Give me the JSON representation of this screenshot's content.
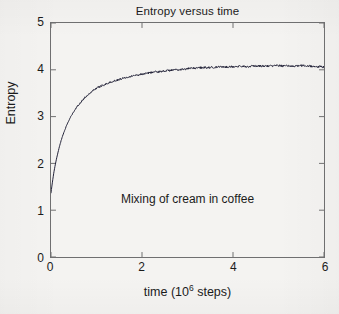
{
  "figure": {
    "background_color": "#f4f3f1",
    "frame_color": "#6f6f70",
    "text_color": "#1b1b1b"
  },
  "chart_data": {
    "type": "line",
    "title": "Entropy versus time",
    "xlabel_prefix": "time (10",
    "xlabel_exponent": "6",
    "xlabel_suffix": " steps)",
    "xlabel_full": "time (10^6 steps)",
    "ylabel": "Entropy",
    "annotation": "Mixing of cream in coffee",
    "xlim": [
      0,
      6
    ],
    "ylim": [
      0,
      5
    ],
    "xticks": [
      0,
      2,
      4,
      6
    ],
    "xtick_labels": [
      "0",
      "2",
      "4",
      "6"
    ],
    "yticks": [
      0,
      1,
      2,
      3,
      4,
      5
    ],
    "ytick_labels": [
      "0",
      "1",
      "2",
      "3",
      "4",
      "5"
    ],
    "grid": false,
    "legend": "none",
    "tick_direction": "in",
    "series": [
      {
        "name": "entropy",
        "color": "#24243a",
        "line_width": 1,
        "x": [
          0.0,
          0.02,
          0.04,
          0.06,
          0.08,
          0.1,
          0.13,
          0.16,
          0.19,
          0.22,
          0.26,
          0.3,
          0.34,
          0.38,
          0.43,
          0.48,
          0.53,
          0.58,
          0.64,
          0.7,
          0.76,
          0.83,
          0.9,
          0.97,
          1.05,
          1.13,
          1.21,
          1.3,
          1.39,
          1.48,
          1.58,
          1.68,
          1.79,
          1.9,
          2.01,
          2.13,
          2.25,
          2.38,
          2.51,
          2.64,
          2.78,
          2.92,
          3.06,
          3.21,
          3.36,
          3.51,
          3.67,
          3.83,
          3.99,
          4.15,
          4.32,
          4.49,
          4.66,
          4.83,
          5.0,
          5.17,
          5.34,
          5.51,
          5.68,
          5.84,
          6.0
        ],
        "y": [
          1.37,
          1.52,
          1.66,
          1.79,
          1.9,
          2.0,
          2.14,
          2.26,
          2.38,
          2.48,
          2.6,
          2.71,
          2.8,
          2.89,
          2.99,
          3.07,
          3.15,
          3.22,
          3.29,
          3.36,
          3.42,
          3.48,
          3.54,
          3.59,
          3.63,
          3.67,
          3.7,
          3.73,
          3.76,
          3.79,
          3.82,
          3.85,
          3.87,
          3.89,
          3.91,
          3.93,
          3.95,
          3.96,
          3.98,
          3.99,
          4.0,
          4.01,
          4.03,
          4.04,
          4.05,
          4.05,
          4.06,
          4.06,
          4.07,
          4.07,
          4.07,
          4.08,
          4.08,
          4.08,
          4.09,
          4.08,
          4.08,
          4.09,
          4.08,
          4.07,
          4.06
        ],
        "noise_amplitude": 0.022
      }
    ]
  }
}
